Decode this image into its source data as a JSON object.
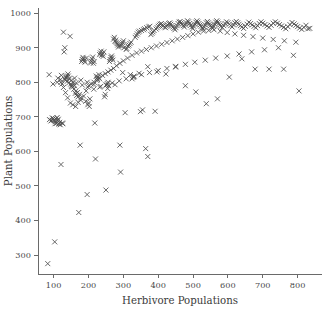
{
  "chart_data": {
    "type": "scatter",
    "title": "",
    "xlabel": "Herbivore Populations",
    "ylabel": "Plant Populations",
    "xlim": [
      55,
      870
    ],
    "ylim": [
      245,
      1015
    ],
    "xticks": [
      100,
      200,
      300,
      400,
      500,
      600,
      700,
      800
    ],
    "yticks": [
      300,
      400,
      500,
      600,
      700,
      800,
      900,
      1000
    ],
    "xtick_labels": [
      "100",
      "200",
      "300",
      "400",
      "500",
      "600",
      "700",
      "800"
    ],
    "ytick_labels": [
      "300",
      "400",
      "500",
      "600",
      "700",
      "800",
      "900",
      "1000"
    ],
    "grid": false,
    "legend": "none",
    "marker": "x",
    "marker_color": "#4d4d4d",
    "series": [
      {
        "name": "observations",
        "x": [
          83,
          88,
          92,
          96,
          99,
          101,
          103,
          104,
          106,
          108,
          110,
          112,
          113,
          115,
          117,
          119,
          121,
          122,
          124,
          126,
          128,
          130,
          132,
          133,
          135,
          137,
          139,
          141,
          143,
          145,
          147,
          149,
          151,
          152,
          154,
          156,
          158,
          160,
          162,
          164,
          166,
          168,
          170,
          172,
          174,
          176,
          178,
          180,
          182,
          184,
          186,
          188,
          190,
          192,
          194,
          196,
          198,
          200,
          202,
          204,
          206,
          208,
          210,
          212,
          214,
          216,
          218,
          220,
          222,
          224,
          226,
          228,
          230,
          232,
          234,
          236,
          238,
          240,
          242,
          244,
          246,
          248,
          250,
          252,
          254,
          256,
          258,
          260,
          262,
          264,
          266,
          268,
          270,
          272,
          274,
          276,
          278,
          280,
          282,
          284,
          286,
          288,
          290,
          292,
          294,
          296,
          298,
          300,
          302,
          305,
          308,
          310,
          313,
          316,
          319,
          322,
          325,
          328,
          331,
          334,
          337,
          340,
          343,
          346,
          349,
          352,
          355,
          358,
          361,
          364,
          367,
          370,
          373,
          376,
          379,
          382,
          385,
          388,
          391,
          394,
          397,
          400,
          403,
          406,
          409,
          412,
          415,
          418,
          421,
          424,
          427,
          430,
          433,
          436,
          439,
          442,
          445,
          448,
          451,
          454,
          457,
          460,
          463,
          466,
          469,
          472,
          475,
          478,
          481,
          484,
          487,
          490,
          493,
          496,
          499,
          502,
          505,
          508,
          511,
          514,
          517,
          520,
          523,
          526,
          529,
          532,
          535,
          538,
          541,
          544,
          547,
          550,
          553,
          556,
          559,
          562,
          565,
          568,
          571,
          574,
          577,
          580,
          584,
          588,
          592,
          596,
          600,
          604,
          608,
          612,
          616,
          620,
          624,
          628,
          632,
          636,
          640,
          645,
          650,
          655,
          660,
          665,
          670,
          675,
          680,
          685,
          690,
          695,
          700,
          706,
          712,
          718,
          724,
          730,
          736,
          742,
          748,
          754,
          760,
          766,
          772,
          778,
          784,
          790,
          795,
          800,
          806,
          812,
          818,
          824,
          830,
          835,
          87,
          95,
          104,
          112,
          121,
          128,
          134,
          140,
          148,
          155,
          163,
          170,
          178,
          186,
          193,
          201,
          208,
          216,
          224,
          232,
          240,
          248,
          256,
          264,
          272,
          280,
          290,
          300,
          312,
          325,
          338,
          352,
          366,
          380,
          395,
          410,
          425,
          440,
          455,
          470,
          485,
          500,
          515,
          530,
          545,
          560,
          578,
          598,
          620,
          645,
          672,
          700,
          730,
          762,
          795,
          120,
          135,
          150,
          165,
          182,
          198,
          215,
          232,
          250,
          268,
          288,
          308,
          330,
          352,
          375,
          400,
          425,
          450,
          478,
          505,
          535,
          565,
          598,
          632,
          668,
          705,
          745,
          788,
          98,
          110,
          125,
          142,
          160,
          178,
          196,
          215,
          235,
          255,
          276,
          298,
          320,
          345,
          370,
          396,
          422,
          450,
          478,
          508,
          538,
          570,
          604,
          640,
          678,
          718,
          760,
          804
        ],
        "y": [
          275,
          692,
          688,
          697,
          695,
          690,
          338,
          686,
          694,
          681,
          698,
          690,
          693,
          679,
          684,
          677,
          562,
          820,
          795,
          680,
          945,
          888,
          900,
          806,
          812,
          818,
          803,
          824,
          798,
          810,
          933,
          795,
          788,
          792,
          786,
          800,
          780,
          790,
          768,
          775,
          762,
          770,
          758,
          423,
          765,
          618,
          755,
          860,
          866,
          872,
          868,
          862,
          858,
          745,
          870,
          475,
          735,
          740,
          730,
          752,
          856,
          861,
          867,
          873,
          855,
          860,
          682,
          578,
          818,
          812,
          808,
          815,
          822,
          880,
          885,
          890,
          878,
          882,
          875,
          888,
          758,
          765,
          488,
          792,
          796,
          800,
          790,
          860,
          866,
          872,
          876,
          870,
          864,
          925,
          930,
          918,
          922,
          916,
          912,
          908,
          902,
          906,
          618,
          540,
          905,
          910,
          915,
          920,
          900,
          712,
          895,
          898,
          905,
          908,
          912,
          916,
          810,
          814,
          818,
          930,
          935,
          940,
          945,
          948,
          715,
          950,
          720,
          952,
          955,
          608,
          958,
          585,
          960,
          962,
          938,
          942,
          946,
          950,
          716,
          954,
          958,
          962,
          965,
          968,
          970,
          966,
          964,
          960,
          958,
          962,
          966,
          970,
          972,
          968,
          964,
          960,
          956,
          952,
          958,
          964,
          970,
          974,
          976,
          972,
          968,
          964,
          960,
          966,
          972,
          978,
          975,
          970,
          965,
          960,
          955,
          962,
          968,
          974,
          978,
          974,
          970,
          966,
          962,
          958,
          954,
          960,
          966,
          972,
          976,
          972,
          968,
          964,
          960,
          956,
          962,
          968,
          974,
          978,
          974,
          970,
          966,
          962,
          958,
          964,
          970,
          975,
          972,
          968,
          964,
          960,
          966,
          972,
          976,
          972,
          968,
          964,
          960,
          956,
          962,
          968,
          974,
          970,
          966,
          962,
          958,
          964,
          970,
          975,
          971,
          967,
          963,
          959,
          965,
          971,
          975,
          971,
          967,
          963,
          959,
          955,
          961,
          967,
          973,
          969,
          965,
          961,
          957,
          953,
          959,
          965,
          955,
          956,
          822,
          690,
          680,
          812,
          800,
          785,
          770,
          755,
          740,
          735,
          730,
          742,
          748,
          760,
          775,
          790,
          795,
          800,
          805,
          810,
          820,
          825,
          830,
          835,
          840,
          848,
          855,
          862,
          870,
          878,
          885,
          890,
          895,
          900,
          905,
          910,
          915,
          920,
          925,
          930,
          935,
          940,
          945,
          948,
          950,
          952,
          948,
          944,
          940,
          936,
          932,
          928,
          924,
          920,
          916,
          808,
          815,
          805,
          798,
          792,
          786,
          780,
          786,
          792,
          798,
          804,
          810,
          816,
          822,
          828,
          834,
          840,
          846,
          852,
          858,
          864,
          870,
          876,
          882,
          888,
          894,
          900,
          878,
          795,
          800,
          682,
          818,
          812,
          806,
          800,
          794,
          788,
          782,
          793,
          828,
          822,
          826,
          845,
          830,
          824,
          844,
          790,
          772,
          738,
          752,
          815,
          868,
          838,
          838,
          838,
          775
        ]
      }
    ]
  }
}
